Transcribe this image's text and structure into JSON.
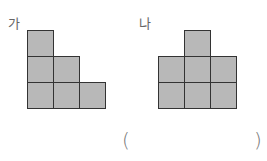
{
  "figures": [
    {
      "label": "가",
      "label_pos": [
        8,
        17
      ],
      "origin": [
        27,
        30
      ],
      "cells": [
        [
          0,
          0
        ],
        [
          0,
          1
        ],
        [
          1,
          1
        ],
        [
          0,
          2
        ],
        [
          1,
          2
        ],
        [
          2,
          2
        ]
      ]
    },
    {
      "label": "나",
      "label_pos": [
        139,
        17
      ],
      "origin": [
        158,
        30
      ],
      "cells": [
        [
          1,
          0
        ],
        [
          0,
          1
        ],
        [
          1,
          1
        ],
        [
          2,
          1
        ],
        [
          0,
          2
        ],
        [
          1,
          2
        ],
        [
          2,
          2
        ]
      ]
    }
  ],
  "answer": {
    "open": "(",
    "close": ")"
  },
  "colors": {
    "cell_fill": "#b8b8b8",
    "cell_border": "#333333"
  }
}
